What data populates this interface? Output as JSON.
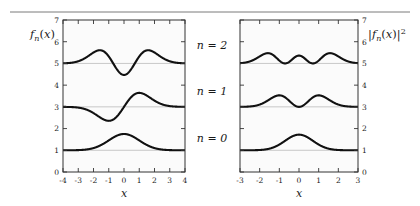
{
  "figure": {
    "background": "#ffffff",
    "top_rule_color": "#7a7a7a",
    "frame_color": "#333333",
    "curve_color": "#111111",
    "potential_color": "#555555",
    "baseline_color": "#bbbbbb",
    "panel_fill": "#fbfbfb"
  },
  "annotations": {
    "n2": "n = 2",
    "n1": "n = 1",
    "n0": "n = 0"
  },
  "chart_data": [
    {
      "type": "line",
      "panel": "left",
      "title": "",
      "xlabel": "x",
      "ylabel": "f_n(x)",
      "ylabel_display": "fn(x)",
      "xlim": [
        -4,
        4
      ],
      "ylim": [
        0,
        7
      ],
      "xticks": [
        -4,
        -3,
        -2,
        -1,
        0,
        1,
        2,
        3,
        4
      ],
      "xtick_labels": [
        "-4",
        "-3",
        "-2",
        "-1",
        "0",
        "1",
        "2",
        "3",
        "4"
      ],
      "yticks": [
        0,
        1,
        2,
        3,
        4,
        5,
        6,
        7
      ],
      "ytick_labels": [
        "0",
        "1",
        "2",
        "3",
        "4",
        "5",
        "6",
        "7"
      ],
      "grid": false,
      "series": [
        {
          "name": "n = 0",
          "kind": "hermite",
          "n": 0,
          "squared": false,
          "offset": 1,
          "amplitude": 0.75,
          "style": "solid",
          "baseline": 1
        },
        {
          "name": "n = 1",
          "kind": "hermite",
          "n": 1,
          "squared": false,
          "offset": 3,
          "amplitude": 0.75,
          "style": "solid",
          "baseline": 3
        },
        {
          "name": "n = 2",
          "kind": "hermite",
          "n": 2,
          "squared": false,
          "offset": 5,
          "amplitude": 0.75,
          "style": "solid",
          "baseline": 5
        },
        {
          "name": "potential",
          "kind": "parabola",
          "coefficient": 1.0,
          "style": "dotted"
        }
      ]
    },
    {
      "type": "line",
      "panel": "right",
      "title": "",
      "xlabel": "x",
      "ylabel": "|f_n(x)|^2",
      "ylabel_display": "|fn(x)|2",
      "xlim": [
        -3,
        3
      ],
      "ylim": [
        0,
        7
      ],
      "xticks": [
        -3,
        -2,
        -1,
        0,
        1,
        2,
        3
      ],
      "xtick_labels": [
        "-3",
        "-2",
        "-1",
        "0",
        "1",
        "2",
        "3"
      ],
      "yticks": [
        0,
        1,
        2,
        3,
        4,
        5,
        6,
        7
      ],
      "ytick_labels": [
        "0",
        "1",
        "2",
        "3",
        "4",
        "5",
        "6",
        "7"
      ],
      "grid": false,
      "series": [
        {
          "name": "n = 0",
          "kind": "hermite",
          "n": 0,
          "squared": true,
          "offset": 1,
          "amplitude": 0.72,
          "style": "solid",
          "baseline": 1
        },
        {
          "name": "n = 1",
          "kind": "hermite",
          "n": 1,
          "squared": true,
          "offset": 3,
          "amplitude": 0.72,
          "style": "solid",
          "baseline": 3
        },
        {
          "name": "n = 2",
          "kind": "hermite",
          "n": 2,
          "squared": true,
          "offset": 5,
          "amplitude": 0.72,
          "style": "solid",
          "baseline": 5
        },
        {
          "name": "potential",
          "kind": "parabola",
          "coefficient": 1.0,
          "style": "dotted"
        }
      ]
    }
  ]
}
